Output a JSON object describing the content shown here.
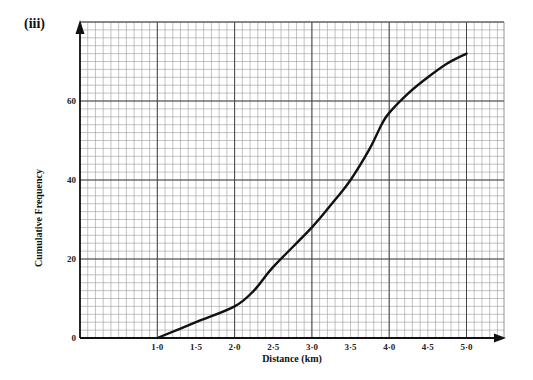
{
  "part_label": "(iii)",
  "chart_data": {
    "type": "line",
    "title": "",
    "xlabel": "Distance (km)",
    "ylabel": "Cumulative Frequency",
    "xlim": [
      0,
      5.5
    ],
    "ylim": [
      0,
      80
    ],
    "x_ticks": [
      {
        "value": 1.0,
        "label": "1·0"
      },
      {
        "value": 1.5,
        "label": "1·5"
      },
      {
        "value": 2.0,
        "label": "2·0"
      },
      {
        "value": 2.5,
        "label": "2·5"
      },
      {
        "value": 3.0,
        "label": "3·0"
      },
      {
        "value": 3.5,
        "label": "3·5"
      },
      {
        "value": 4.0,
        "label": "4·0"
      },
      {
        "value": 4.5,
        "label": "4·5"
      },
      {
        "value": 5.0,
        "label": "5·0"
      }
    ],
    "y_ticks": [
      {
        "value": 0,
        "label": "0"
      },
      {
        "value": 20,
        "label": "20"
      },
      {
        "value": 40,
        "label": "40"
      },
      {
        "value": 60,
        "label": "60"
      }
    ],
    "grid": {
      "major_x_step": 1.0,
      "minor_x_step": 0.1,
      "major_y_step": 20,
      "minor_y_step": 2
    },
    "legend": null,
    "series": [
      {
        "name": "Cumulative frequency curve",
        "x": [
          1.0,
          1.5,
          2.0,
          2.25,
          2.5,
          3.0,
          3.3,
          3.5,
          3.75,
          3.9,
          4.0,
          4.25,
          4.5,
          4.75,
          5.0
        ],
        "y": [
          0,
          4,
          8,
          12,
          18,
          28,
          35,
          40,
          48,
          54,
          57,
          62,
          66,
          69.5,
          72
        ]
      }
    ]
  }
}
